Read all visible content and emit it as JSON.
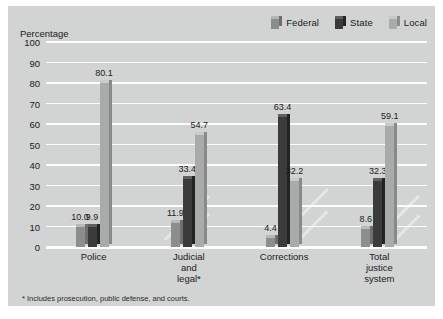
{
  "chart_data": {
    "type": "bar",
    "title": "",
    "ylabel": "Percentage",
    "xlabel": "",
    "ylim": [
      0,
      100
    ],
    "yticks": [
      0,
      10,
      20,
      30,
      40,
      50,
      60,
      70,
      80,
      90,
      100
    ],
    "grid": true,
    "legend_position": "top-right",
    "categories": [
      "Police",
      "Judicial\nand\nlegal*",
      "Corrections",
      "Total\njustice\nsystem"
    ],
    "series": [
      {
        "name": "Federal",
        "color": "#8c8d8d",
        "values": [
          10.0,
          11.9,
          4.4,
          8.6
        ],
        "labels": [
          "10.0",
          "11.9",
          "4.4",
          "8.6"
        ]
      },
      {
        "name": "State",
        "color": "#3b3b3b",
        "values": [
          9.9,
          33.4,
          63.4,
          32.3
        ],
        "labels": [
          "9.9",
          "33.4",
          "63.4",
          "32.3"
        ]
      },
      {
        "name": "Local",
        "color": "#a9aaaa",
        "values": [
          80.1,
          54.7,
          32.2,
          59.1
        ],
        "labels": [
          "80.1",
          "54.7",
          "32.2",
          "59.1"
        ]
      }
    ],
    "footnote": "* Includes prosecution, public defense, and courts."
  },
  "colors": {
    "plot_background": "#d2d3d3",
    "gridline": "#fdfdfd",
    "text": "#1a1a1a",
    "federal": "#8c8d8d",
    "state": "#3b3b3b",
    "local": "#a9aaaa"
  }
}
